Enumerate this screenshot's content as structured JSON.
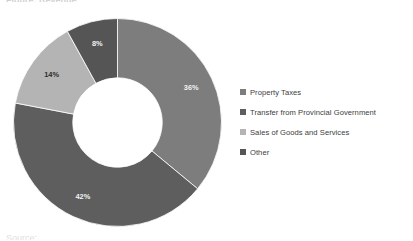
{
  "cropped_text": {
    "top": "Figure: Revenue",
    "bottom": "Source:"
  },
  "legend": {
    "items": [
      {
        "label": "Property Taxes",
        "color": "#7d7d7d"
      },
      {
        "label": "Transfer from Provincial Government",
        "color": "#5e5e5e"
      },
      {
        "label": "Sales of Goods and Services",
        "color": "#b4b4b4"
      },
      {
        "label": "Other",
        "color": "#555555"
      }
    ]
  },
  "chart_data": {
    "type": "pie",
    "variant": "donut",
    "title": "",
    "categories": [
      "Property Taxes",
      "Transfer from Provincial Government",
      "Sales of Goods and Services",
      "Other"
    ],
    "values": [
      36,
      42,
      14,
      8
    ],
    "unit": "%",
    "data_labels": [
      "36%",
      "42%",
      "14%",
      "8%"
    ],
    "label_text_colors": [
      "light",
      "light",
      "dark",
      "light"
    ],
    "colors": [
      "#7d7d7d",
      "#5e5e5e",
      "#b4b4b4",
      "#555555"
    ],
    "start_angle_deg": 0,
    "direction": "clockwise",
    "inner_radius_ratio": 0.43,
    "legend_position": "right",
    "grid": false,
    "total": 100
  }
}
